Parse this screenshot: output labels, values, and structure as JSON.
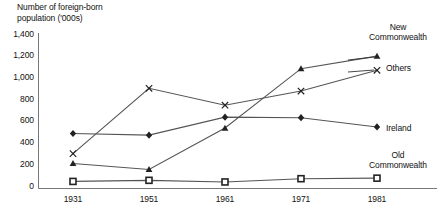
{
  "chart_data": {
    "type": "line",
    "title": "Number of foreign-born\npopulation  ('000s)",
    "xlabel": "",
    "ylabel": "Number of foreign-born population ('000s)",
    "categories": [
      "1931",
      "1951",
      "1961",
      "1971",
      "1981"
    ],
    "ylim": [
      0,
      1400
    ],
    "yticks": [
      "0",
      "200",
      "400",
      "600",
      "800",
      "1,000",
      "1,200",
      "1,400"
    ],
    "ytick_values": [
      0,
      200,
      400,
      600,
      800,
      1000,
      1200,
      1400
    ],
    "grid": false,
    "legend_position": "right-inline-labels",
    "series": [
      {
        "name": "New Commonwealth",
        "marker": "triangle",
        "values": [
          230,
          175,
          555,
          1100,
          1215
        ]
      },
      {
        "name": "Others",
        "marker": "cross",
        "values": [
          320,
          920,
          765,
          895,
          1085
        ]
      },
      {
        "name": "Ireland",
        "marker": "diamond",
        "values": [
          505,
          490,
          655,
          650,
          565
        ]
      },
      {
        "name": "Old Commonwealth",
        "marker": "square",
        "values": [
          65,
          75,
          60,
          90,
          95
        ]
      }
    ]
  },
  "labels": {
    "new_commonwealth": "New\nCommonwealth",
    "others": "Others",
    "ireland": "Ireland",
    "old_commonwealth": "Old\nCommonwealth"
  },
  "colors": {
    "line": "#555555",
    "marker": "#222222",
    "axis": "#888888",
    "text": "#111111"
  }
}
